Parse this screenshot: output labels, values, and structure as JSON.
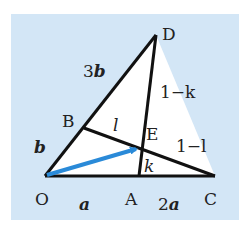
{
  "diagram": {
    "colors": {
      "background": "#d3e6f6",
      "triangle_fill": "#ffffff",
      "line": "#111111",
      "vector": "#2a8ad8"
    },
    "points": {
      "O": {
        "label": "O",
        "x": 45,
        "y": 176
      },
      "A": {
        "label": "A",
        "x": 139,
        "y": 176
      },
      "C": {
        "label": "C",
        "x": 215,
        "y": 176
      },
      "D": {
        "label": "D",
        "x": 156,
        "y": 35
      },
      "B": {
        "label": "B",
        "x": 84,
        "y": 128
      },
      "E": {
        "label": "E",
        "x": 142,
        "y": 148
      }
    },
    "segment_labels": {
      "OB": "b",
      "BD_coef": "3",
      "BD_vec": "b",
      "OA": "a",
      "AC_coef": "2",
      "AC_vec": "a",
      "BE": "l",
      "EC": "1−l",
      "AE": "k",
      "ED": "1−k"
    }
  }
}
